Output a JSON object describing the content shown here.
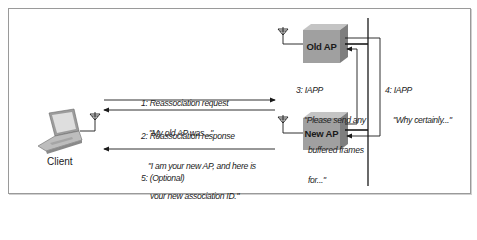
{
  "diagram": {
    "nodes": {
      "client": {
        "label": "Client"
      },
      "old_ap": {
        "label": "Old AP"
      },
      "new_ap": {
        "label": "New AP"
      }
    },
    "messages": [
      {
        "step": "1",
        "title": "1: Reassociation request",
        "lines": [
          "\"My old AP was...\""
        ],
        "from": "Client",
        "to": "New AP"
      },
      {
        "step": "2",
        "title": "2: Reassociation response",
        "lines": [
          "\"I am your new AP, and here is",
          "your new association ID.\""
        ],
        "from": "New AP",
        "to": "Client"
      },
      {
        "step": "3",
        "title": "3: IAPP",
        "lines": [
          "\"Please send any",
          "buffered frames",
          "for...\""
        ],
        "from": "New AP",
        "to": "Old AP"
      },
      {
        "step": "4",
        "title": "4: IAPP",
        "lines": [
          "\"Why certainly...\""
        ],
        "from": "Old AP",
        "to": "New AP"
      },
      {
        "step": "5",
        "title": "5: (Optional)",
        "lines": [
          "\"Here are some frames",
          "buffered from your old AP.\""
        ],
        "from": "New AP",
        "to": "Client"
      }
    ],
    "icons": [
      "laptop-icon",
      "antenna-icon",
      "access-point-box-icon"
    ],
    "colors": {
      "ap_front": "#9a9a9a",
      "ap_top": "#bdbdbd",
      "ap_side": "#7c7c7c",
      "line": "#1a1a1a",
      "frame": "#9a9a9a"
    }
  }
}
